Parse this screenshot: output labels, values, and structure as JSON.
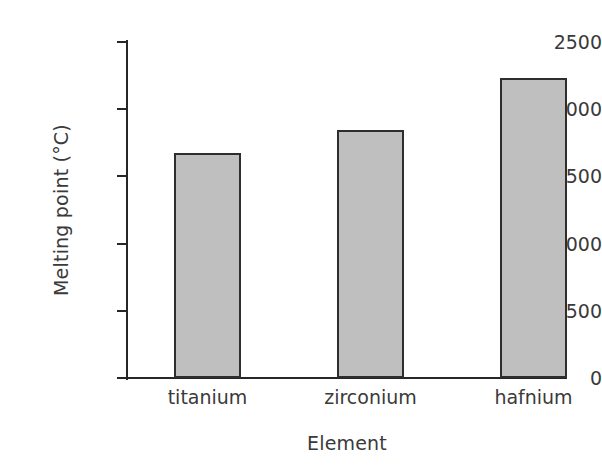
{
  "chart_data": {
    "type": "bar",
    "title": "",
    "xlabel": "Element",
    "ylabel": "Melting point (°C)",
    "categories": [
      "titanium",
      "zirconium",
      "hafnium"
    ],
    "values": [
      1675,
      1845,
      2230
    ],
    "ylim": [
      0,
      2500
    ],
    "yticks": [
      0,
      500,
      1000,
      1500,
      2000,
      2500
    ],
    "ytick_labels": [
      "0",
      "500",
      "1000",
      "1500",
      "2000",
      "2500"
    ],
    "grid": false,
    "legend": null,
    "bar_color": "#bfbfbf",
    "bar_edge_color": "#2e2e2e",
    "axis_color": "#262626",
    "text_color": "#3a3a3a",
    "background": "#ffffff"
  }
}
